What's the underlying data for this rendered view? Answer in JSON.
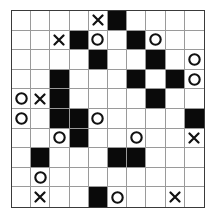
{
  "puzzle": {
    "type": "tic-tac-logic grid",
    "rows": 10,
    "cols": 10,
    "legend": {
      "X": "cross",
      "O": "circle",
      "#": "black-cell",
      ".": "empty"
    },
    "grid": [
      [
        ".",
        ".",
        ".",
        ".",
        "X",
        "#",
        ".",
        ".",
        ".",
        "."
      ],
      [
        ".",
        ".",
        "X",
        "#",
        "O",
        ".",
        "#",
        "O",
        ".",
        "."
      ],
      [
        ".",
        ".",
        ".",
        ".",
        "#",
        ".",
        ".",
        "#",
        ".",
        "O"
      ],
      [
        ".",
        ".",
        "#",
        ".",
        ".",
        ".",
        "#",
        ".",
        "#",
        "O"
      ],
      [
        "O",
        "X",
        "#",
        ".",
        ".",
        ".",
        ".",
        "#",
        ".",
        "."
      ],
      [
        "O",
        ".",
        "#",
        "#",
        "O",
        ".",
        ".",
        ".",
        ".",
        "#"
      ],
      [
        ".",
        ".",
        "O",
        "#",
        ".",
        ".",
        "O",
        ".",
        ".",
        "X"
      ],
      [
        ".",
        "#",
        ".",
        ".",
        ".",
        "#",
        "#",
        ".",
        ".",
        "."
      ],
      [
        ".",
        "O",
        ".",
        ".",
        ".",
        ".",
        ".",
        ".",
        ".",
        "."
      ],
      [
        ".",
        "X",
        ".",
        ".",
        "#",
        "O",
        ".",
        ".",
        "X",
        "."
      ]
    ],
    "colors": {
      "black_cell": "#0a0a0a",
      "grid_line": "#9a9a9a",
      "border": "#3a3a3a",
      "mark": "#111111"
    }
  }
}
